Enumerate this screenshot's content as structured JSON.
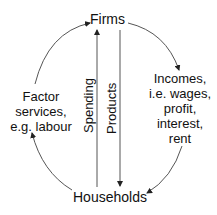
{
  "diagram": {
    "nodes": {
      "firms": "Firms",
      "households": "Households"
    },
    "flows": {
      "factor_services": [
        "Factor",
        "services,",
        "e.g. labour"
      ],
      "incomes": [
        "Incomes,",
        "i.e. wages,",
        "profit,",
        "interest,",
        "rent"
      ],
      "spending": "Spending",
      "products": "Products"
    },
    "edges": [
      {
        "from": "households",
        "to": "firms",
        "label": "Factor services, e.g. labour",
        "side": "left"
      },
      {
        "from": "firms",
        "to": "households",
        "label": "Incomes, i.e. wages, profit, interest, rent",
        "side": "right"
      },
      {
        "from": "households",
        "to": "firms",
        "label": "Spending",
        "direction": "up"
      },
      {
        "from": "firms",
        "to": "households",
        "label": "Products",
        "direction": "down"
      }
    ],
    "colors": {
      "line": "#555555",
      "text": "#111111"
    }
  }
}
